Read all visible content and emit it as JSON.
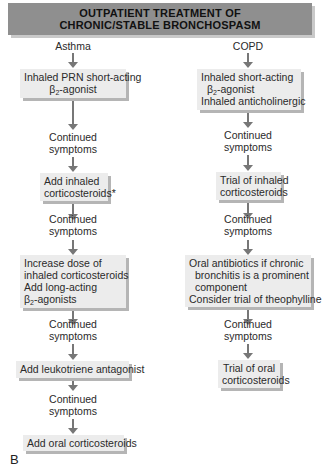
{
  "title": {
    "line1": "OUTPATIENT TREATMENT OF",
    "line2": "CHRONIC/STABLE BRONCHOSPASM"
  },
  "panel_label": "B",
  "colors": {
    "banner": "#8f8f8f",
    "box_fill": "#ececec",
    "box_shadow": "#b5b5b5",
    "arrow": "#777777"
  },
  "asthma": {
    "header": "Asthma",
    "continued": [
      "Continued",
      "symptoms"
    ],
    "steps": [
      {
        "lines": [
          "Inhaled PRN short-acting",
          "β2-agonist"
        ]
      },
      {
        "lines": [
          "Add inhaled",
          "corticosteroids*"
        ]
      },
      {
        "lines": [
          "Increase dose of",
          "inhaled corticosteroids",
          "Add long-acting",
          "β2-agonists"
        ]
      },
      {
        "lines": [
          "Add leukotriene antagonist"
        ]
      },
      {
        "lines": [
          "Add oral corticosteroids"
        ]
      }
    ]
  },
  "copd": {
    "header": "COPD",
    "continued": [
      "Continued",
      "symptoms"
    ],
    "steps": [
      {
        "lines": [
          "Inhaled short-acting",
          "β2-agonist",
          "Inhaled anticholinergic"
        ]
      },
      {
        "lines": [
          "Trial of inhaled",
          "corticosteroids"
        ]
      },
      {
        "lines": [
          "Oral antibiotics if chronic",
          "bronchitis is a prominent",
          "component",
          "Consider trial of theophylline"
        ]
      },
      {
        "lines": [
          "Trial of oral",
          "corticosteroids"
        ]
      }
    ]
  }
}
